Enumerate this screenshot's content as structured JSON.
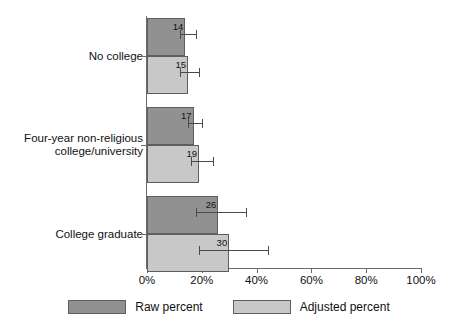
{
  "chart_data": {
    "type": "bar",
    "orientation": "horizontal",
    "title": "",
    "xlabel": "",
    "ylabel": "",
    "xlim": [
      0,
      100
    ],
    "grid": false,
    "legend_position": "bottom",
    "categories": [
      "No college",
      "Four-year non-religious\ncollege/university",
      "College graduate"
    ],
    "xtick_labels": [
      "0%",
      "20%",
      "40%",
      "60%",
      "80%",
      "100%"
    ],
    "xtick_values": [
      0,
      20,
      40,
      60,
      80,
      100
    ],
    "series": [
      {
        "name": "Raw percent",
        "color": "#919191",
        "values": [
          14,
          15,
          26
        ],
        "value_labels": [
          "14",
          "17",
          "26"
        ],
        "error_low": [
          12,
          15,
          18
        ],
        "error_high": [
          18,
          20,
          36
        ]
      },
      {
        "name": "Adjusted percent",
        "color": "#c8c8c8",
        "values": [
          15,
          19,
          30
        ],
        "value_labels": [
          "15",
          "19",
          "30"
        ],
        "error_low": [
          12,
          16,
          19
        ],
        "error_high": [
          19,
          24,
          44
        ]
      }
    ],
    "groups": [
      {
        "category": "No college",
        "bars": [
          {
            "series": "Raw percent",
            "value": 14,
            "label": "14",
            "ci_low": 12,
            "ci_high": 18
          },
          {
            "series": "Adjusted percent",
            "value": 15,
            "label": "15",
            "ci_low": 12,
            "ci_high": 19
          }
        ]
      },
      {
        "category": "Four-year non-religious\ncollege/university",
        "bars": [
          {
            "series": "Raw percent",
            "value": 17,
            "label": "17",
            "ci_low": 15,
            "ci_high": 20
          },
          {
            "series": "Adjusted percent",
            "value": 19,
            "label": "19",
            "ci_low": 16,
            "ci_high": 24
          }
        ]
      },
      {
        "category": "College graduate",
        "bars": [
          {
            "series": "Raw percent",
            "value": 26,
            "label": "26",
            "ci_low": 18,
            "ci_high": 36
          },
          {
            "series": "Adjusted percent",
            "value": 30,
            "label": "30",
            "ci_low": 19,
            "ci_high": 44
          }
        ]
      }
    ]
  },
  "legend": {
    "items": [
      {
        "label": "Raw percent",
        "color": "#919191"
      },
      {
        "label": "Adjusted percent",
        "color": "#c8c8c8"
      }
    ]
  },
  "colors": {
    "raw": "#919191",
    "adjusted": "#c8c8c8",
    "axis": "#6b6b6b",
    "error": "#4a4a4a",
    "background": "#ffffff"
  }
}
